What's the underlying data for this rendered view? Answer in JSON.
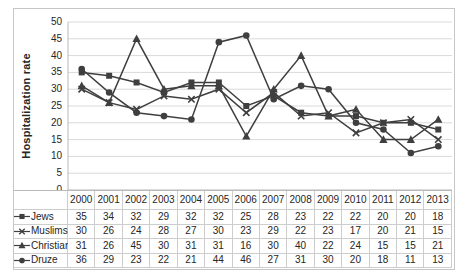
{
  "chart": {
    "title": "",
    "y_axis_title": "Hospitalization rate"
  },
  "chart_data": {
    "type": "line",
    "title": "",
    "xlabel": "",
    "ylabel": "Hospitalization rate",
    "ylim": [
      0,
      50
    ],
    "y_ticks": [
      0,
      5,
      10,
      15,
      20,
      25,
      30,
      35,
      40,
      45,
      50
    ],
    "grid": true,
    "legend_position": "table-left",
    "categories": [
      "2000",
      "2001",
      "2002",
      "2003",
      "2004",
      "2005",
      "2006",
      "2007",
      "2008",
      "2009",
      "2010",
      "2011",
      "2012",
      "2013"
    ],
    "series": [
      {
        "name": "Jews",
        "marker": "square",
        "values": [
          35,
          34,
          32,
          29,
          32,
          32,
          25,
          28,
          23,
          22,
          22,
          20,
          20,
          18
        ]
      },
      {
        "name": "Muslims",
        "marker": "x",
        "values": [
          30,
          26,
          24,
          28,
          27,
          30,
          23,
          29,
          22,
          23,
          17,
          20,
          21,
          15
        ]
      },
      {
        "name": "Christians",
        "marker": "triangle",
        "values": [
          31,
          26,
          45,
          30,
          31,
          31,
          16,
          30,
          40,
          22,
          24,
          15,
          15,
          21
        ]
      },
      {
        "name": "Druze",
        "marker": "circle",
        "values": [
          36,
          29,
          23,
          22,
          21,
          44,
          46,
          27,
          31,
          30,
          20,
          18,
          11,
          13
        ]
      }
    ]
  },
  "colors": {
    "series_stroke": "#3f3f3f",
    "gridline": "#d9d9d9",
    "axis_line": "#b9b9b9",
    "table_border": "#cdcdcd",
    "outer_border": "#c6c6c6",
    "text": "#262626",
    "background": "#ffffff"
  }
}
